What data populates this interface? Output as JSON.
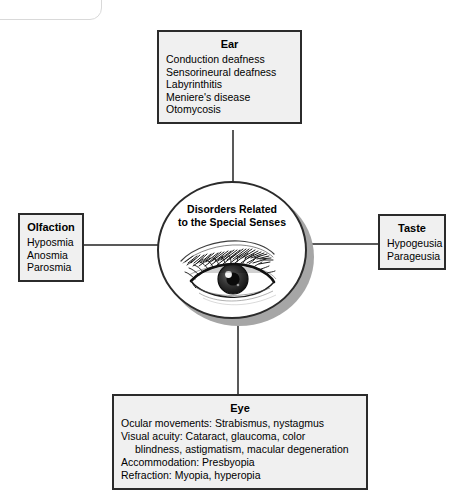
{
  "diagram": {
    "center": {
      "title_line1": "Disorders Related",
      "title_line2": "to the Special Senses",
      "illustration": "human-eye-illustration"
    },
    "nodes": {
      "ear": {
        "title": "Ear",
        "items": [
          "Conduction deafness",
          "Sensorineural deafness",
          "Labyrinthitis",
          "Meniere's disease",
          "Otomycosis"
        ]
      },
      "olfaction": {
        "title": "Olfaction",
        "items": [
          "Hyposmia",
          "Anosmia",
          "Parosmia"
        ]
      },
      "taste": {
        "title": "Taste",
        "items": [
          "Hypogeusia",
          "Parageusia"
        ]
      },
      "eye": {
        "title": "Eye",
        "items": [
          "Ocular movements: Strabismus, nystagmus",
          "Visual acuity: Cataract, glaucoma, color blindness, astigmatism, macular degeneration",
          "Accommodation: Presbyopia",
          "Refraction: Myopia, hyperopia"
        ],
        "line_visual_acuity_part1": "Visual acuity: Cataract, glaucoma, color",
        "line_visual_acuity_part2": "blindness, astigmatism, macular degeneration"
      }
    },
    "colors": {
      "box_fill": "#f0f0f0",
      "box_border": "#2b2b2b",
      "shadow": "#a6a6a6",
      "connector": "#595959",
      "text": "#000000",
      "center_fill": "#ffffff"
    }
  }
}
